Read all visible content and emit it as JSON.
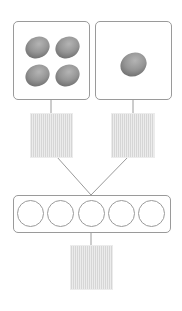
{
  "diagram": {
    "type": "number-bond-addition",
    "accent_color": "#9a9a9a",
    "answer_fill_color": "#e4e4e4",
    "stone_color": "#8a8a8a",
    "groups": [
      {
        "id": "left",
        "stone_count": 4,
        "label": ""
      },
      {
        "id": "right",
        "stone_count": 1,
        "label": ""
      }
    ],
    "answer_boxes": [
      {
        "id": "left-answer",
        "value": ""
      },
      {
        "id": "right-answer",
        "value": ""
      },
      {
        "id": "total-answer",
        "value": ""
      }
    ],
    "ten_frame": {
      "cell_count": 5,
      "filled": 0
    }
  }
}
